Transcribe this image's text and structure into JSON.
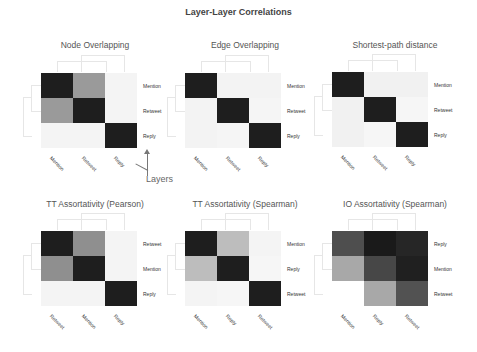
{
  "title": "Layer-Layer Correlations",
  "annotation": {
    "label": "Layers"
  },
  "chart_data": [
    {
      "type": "heatmap",
      "title": "Node Overlapping",
      "rows": [
        "Mention",
        "Retweet",
        "Reply"
      ],
      "cols": [
        "Mention",
        "Retweet",
        "Reply"
      ],
      "values": [
        [
          1.0,
          0.45,
          0.03
        ],
        [
          0.45,
          1.0,
          0.03
        ],
        [
          0.03,
          0.03,
          1.0
        ]
      ],
      "colors": [
        [
          "#1e1e1e",
          "#9a9a9a",
          "#f4f4f4"
        ],
        [
          "#9a9a9a",
          "#1e1e1e",
          "#f4f4f4"
        ],
        [
          "#f4f4f4",
          "#f4f4f4",
          "#1e1e1e"
        ]
      ]
    },
    {
      "type": "heatmap",
      "title": "Edge Overlapping",
      "rows": [
        "Mention",
        "Retweet",
        "Reply"
      ],
      "cols": [
        "Mention",
        "Retweet",
        "Reply"
      ],
      "values": [
        [
          1.0,
          0.03,
          0.03
        ],
        [
          0.03,
          1.0,
          0.02
        ],
        [
          0.03,
          0.02,
          1.0
        ]
      ],
      "colors": [
        [
          "#1e1e1e",
          "#f3f3f3",
          "#f3f3f3"
        ],
        [
          "#f3f3f3",
          "#1e1e1e",
          "#f5f5f5"
        ],
        [
          "#f3f3f3",
          "#f5f5f5",
          "#1e1e1e"
        ]
      ]
    },
    {
      "type": "heatmap",
      "title": "Shortest-path distance",
      "rows": [
        "Mention",
        "Retweet",
        "Reply"
      ],
      "cols": [
        "Mention",
        "Retweet",
        "Reply"
      ],
      "values": [
        [
          1.0,
          0.04,
          0.04
        ],
        [
          0.04,
          1.0,
          0.02
        ],
        [
          0.04,
          0.02,
          1.0
        ]
      ],
      "colors": [
        [
          "#1e1e1e",
          "#f1f1f1",
          "#f1f1f1"
        ],
        [
          "#f1f1f1",
          "#1e1e1e",
          "#f6f6f6"
        ],
        [
          "#f1f1f1",
          "#f6f6f6",
          "#1e1e1e"
        ]
      ]
    },
    {
      "type": "heatmap",
      "title": "TT Assortativity (Pearson)",
      "rows": [
        "Retweet",
        "Mention",
        "Reply"
      ],
      "cols": [
        "Retweet",
        "Mention",
        "Reply"
      ],
      "values": [
        [
          1.0,
          0.5,
          0.03
        ],
        [
          0.5,
          1.0,
          0.03
        ],
        [
          0.03,
          0.03,
          1.0
        ]
      ],
      "colors": [
        [
          "#1e1e1e",
          "#8f8f8f",
          "#f4f4f4"
        ],
        [
          "#8f8f8f",
          "#1e1e1e",
          "#f4f4f4"
        ],
        [
          "#f4f4f4",
          "#f4f4f4",
          "#1e1e1e"
        ]
      ]
    },
    {
      "type": "heatmap",
      "title": "TT Assortativity (Spearman)",
      "rows": [
        "Mention",
        "Reply",
        "Retweet"
      ],
      "cols": [
        "Mention",
        "Reply",
        "Retweet"
      ],
      "values": [
        [
          1.0,
          0.3,
          0.03
        ],
        [
          0.3,
          1.0,
          0.02
        ],
        [
          0.03,
          0.02,
          1.0
        ]
      ],
      "colors": [
        [
          "#1e1e1e",
          "#bdbdbd",
          "#f4f4f4"
        ],
        [
          "#bdbdbd",
          "#1e1e1e",
          "#f6f6f6"
        ],
        [
          "#f4f4f4",
          "#f6f6f6",
          "#1e1e1e"
        ]
      ]
    },
    {
      "type": "heatmap",
      "title": "IO Assortativity (Spearman)",
      "rows": [
        "Reply",
        "Mention",
        "Retweet"
      ],
      "cols": [
        "Mention",
        "Reply",
        "Retweet"
      ],
      "values": [
        [
          0.75,
          0.98,
          0.93
        ],
        [
          0.38,
          0.78,
          0.95
        ],
        [
          null,
          0.38,
          0.75
        ]
      ],
      "colors": [
        [
          "#4e4e4e",
          "#1a1a1a",
          "#262626"
        ],
        [
          "#a8a8a8",
          "#474747",
          "#202020"
        ],
        [
          "#ffffff",
          "#a8a8a8",
          "#525252"
        ]
      ]
    }
  ]
}
